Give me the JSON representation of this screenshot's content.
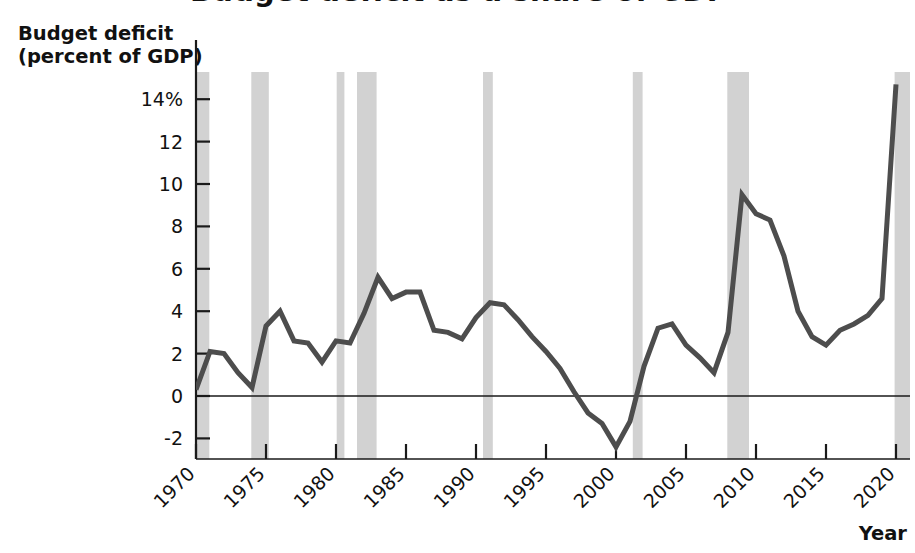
{
  "figure": {
    "clipped_title_fragment": "Budget deficit as a share of GDP",
    "y_axis_label_line1": "Budget deficit",
    "y_axis_label_line2": "(percent of GDP)",
    "x_axis_label": "Year",
    "line_color": "#4d4d4d",
    "recession_band_color": "#d2d2d2",
    "axis_color": "#1a1a1a",
    "background_color": "#ffffff"
  },
  "chart_data": {
    "type": "line",
    "title": "Budget deficit as a share of GDP",
    "xlabel": "Year",
    "ylabel": "Budget deficit (percent of GDP)",
    "xlim": [
      1970,
      2021
    ],
    "ylim": [
      -3.2,
      15.0
    ],
    "grid": false,
    "legend": null,
    "y_ticks": [
      -2,
      0,
      2,
      4,
      6,
      8,
      10,
      12,
      14
    ],
    "y_tick_labels": [
      "-2",
      "0",
      "2",
      "4",
      "6",
      "8",
      "10",
      "12",
      "14%"
    ],
    "x_ticks": [
      1970,
      1975,
      1980,
      1985,
      1990,
      1995,
      2000,
      2005,
      2010,
      2015,
      2020
    ],
    "x_tick_labels": [
      "1970",
      "1975",
      "1980",
      "1985",
      "1990",
      "1995",
      "2000",
      "2005",
      "2010",
      "2015",
      "2020"
    ],
    "x_tick_rotation_deg": 45,
    "zero_line": 0,
    "series": [
      {
        "name": "Budget deficit (percent of GDP)",
        "x": [
          1970,
          1971,
          1972,
          1973,
          1974,
          1975,
          1976,
          1977,
          1978,
          1979,
          1980,
          1981,
          1982,
          1983,
          1984,
          1985,
          1986,
          1987,
          1988,
          1989,
          1990,
          1991,
          1992,
          1993,
          1994,
          1995,
          1996,
          1997,
          1998,
          1999,
          2000,
          2001,
          2002,
          2003,
          2004,
          2005,
          2006,
          2007,
          2008,
          2009,
          2010,
          2011,
          2012,
          2013,
          2014,
          2015,
          2016,
          2017,
          2018,
          2019,
          2020
        ],
        "values": [
          0.3,
          2.1,
          2.0,
          1.1,
          0.4,
          3.3,
          4.0,
          2.6,
          2.5,
          1.6,
          2.6,
          2.5,
          3.9,
          5.6,
          4.6,
          4.9,
          4.9,
          3.1,
          3.0,
          2.7,
          3.7,
          4.4,
          4.3,
          3.6,
          2.8,
          2.1,
          1.3,
          0.2,
          -0.8,
          -1.3,
          -2.4,
          -1.2,
          1.4,
          3.2,
          3.4,
          2.4,
          1.8,
          1.1,
          3.0,
          9.5,
          8.6,
          8.3,
          6.6,
          4.0,
          2.8,
          2.4,
          3.1,
          3.4,
          3.8,
          4.6,
          14.7
        ]
      }
    ],
    "recession_bands": [
      {
        "start": 1969.95,
        "end": 1970.95
      },
      {
        "start": 1973.95,
        "end": 1975.2
      },
      {
        "start": 1980.05,
        "end": 1980.6
      },
      {
        "start": 1981.5,
        "end": 1982.9
      },
      {
        "start": 1990.5,
        "end": 1991.2
      },
      {
        "start": 2001.2,
        "end": 2001.9
      },
      {
        "start": 2007.95,
        "end": 2009.5
      },
      {
        "start": 2019.9,
        "end": 2021.0
      }
    ],
    "annotations": []
  }
}
